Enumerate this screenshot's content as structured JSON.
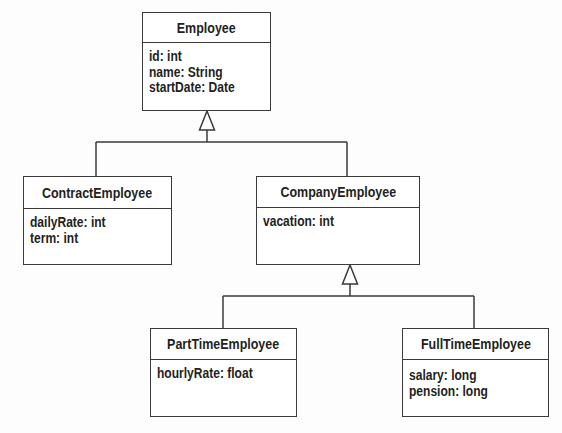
{
  "diagram": {
    "type": "UML class diagram",
    "classes": {
      "employee": {
        "name": "Employee",
        "attributes": [
          "id: int",
          "name: String",
          "startDate: Date"
        ]
      },
      "contract_employee": {
        "name": "ContractEmployee",
        "attributes": [
          "dailyRate: int",
          "term: int"
        ],
        "extends": "Employee"
      },
      "company_employee": {
        "name": "CompanyEmployee",
        "attributes": [
          "vacation: int"
        ],
        "extends": "Employee"
      },
      "part_time_employee": {
        "name": "PartTimeEmployee",
        "attributes": [
          "hourlyRate: float"
        ],
        "extends": "CompanyEmployee"
      },
      "full_time_employee": {
        "name": "FullTimeEmployee",
        "attributes": [
          "salary: long",
          "pension: long"
        ],
        "extends": "CompanyEmployee"
      }
    },
    "relationships": [
      {
        "type": "generalization",
        "from": "ContractEmployee",
        "to": "Employee"
      },
      {
        "type": "generalization",
        "from": "CompanyEmployee",
        "to": "Employee"
      },
      {
        "type": "generalization",
        "from": "PartTimeEmployee",
        "to": "CompanyEmployee"
      },
      {
        "type": "generalization",
        "from": "FullTimeEmployee",
        "to": "CompanyEmployee"
      }
    ],
    "colors": {
      "line": "#3a3a3a",
      "background": "#fdfdfd",
      "text": "#231f20"
    }
  }
}
